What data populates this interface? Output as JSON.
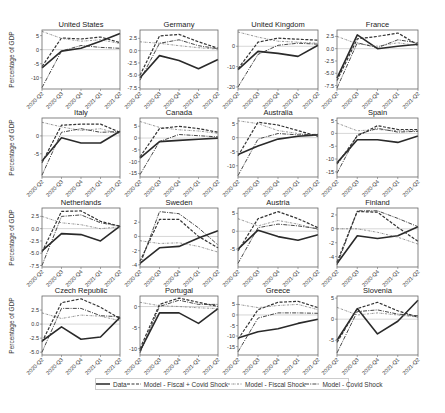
{
  "chart_data": {
    "type": "line",
    "layout": "4x4 small multiples",
    "ylabel": "Percentage of GDP",
    "x": [
      "2020-Q2",
      "2020-Q3",
      "2020-Q4",
      "2021-Q1",
      "2021-Q2"
    ],
    "legend": [
      {
        "name": "Data",
        "style": "solid",
        "width": 1.6
      },
      {
        "name": "Model - Fiscal + Covid Shock",
        "style": "dashed",
        "width": 1.2
      },
      {
        "name": "Model - Fiscal Shock",
        "style": "dotted-dash-thin",
        "width": 0.7
      },
      {
        "name": "Model - Covid Shock",
        "style": "dashdot",
        "width": 0.9
      }
    ],
    "panels": [
      {
        "title": "United States",
        "ylim": [
          -14,
          7
        ],
        "yticks": [
          5,
          0,
          -5,
          -10
        ],
        "ylabels": [
          "5",
          "0",
          "-5",
          "-10"
        ],
        "series": [
          [
            -6.5,
            -0.5,
            0.5,
            3.0,
            5.8
          ],
          [
            -6.0,
            4.2,
            3.8,
            4.5,
            2.5
          ],
          [
            6.5,
            4.0,
            3.0,
            3.5,
            2.2
          ],
          [
            -13.5,
            -0.5,
            1.5,
            0.8,
            0.5
          ]
        ]
      },
      {
        "title": "Germany",
        "ylim": [
          -7.8,
          4.2
        ],
        "yticks": [
          2.5,
          0,
          -2.5,
          -5,
          -7.5
        ],
        "ylabels": [
          "2.5",
          "0.0",
          "-2.5",
          "-5.0",
          "-7.5"
        ],
        "series": [
          [
            -5.5,
            -1.0,
            -2.0,
            -3.7,
            -1.8
          ],
          [
            -5.0,
            3.0,
            3.3,
            1.8,
            0.5
          ],
          [
            1.8,
            1.5,
            1.0,
            0.6,
            0.3
          ],
          [
            -6.0,
            1.5,
            2.2,
            1.0,
            0.4
          ]
        ]
      },
      {
        "title": "United Kingdom",
        "ylim": [
          -21,
          8
        ],
        "yticks": [
          0,
          -10,
          -20
        ],
        "ylabels": [
          "0",
          "-10",
          "-20"
        ],
        "series": [
          [
            -11.5,
            -2.5,
            -3.5,
            -5.0,
            0.5
          ],
          [
            -11.0,
            2.0,
            4.0,
            3.5,
            3.0
          ],
          [
            7.0,
            4.5,
            2.5,
            2.0,
            1.5
          ],
          [
            -20.0,
            -4.0,
            0.5,
            1.5,
            1.0
          ]
        ]
      },
      {
        "title": "France",
        "ylim": [
          -8.2,
          3.8
        ],
        "yticks": [
          2.5,
          0,
          -2.5,
          -5,
          -7.5
        ],
        "ylabels": [
          "2.5",
          "0.0",
          "-2.5",
          "-5.0",
          "-7.5"
        ],
        "series": [
          [
            -6.0,
            2.8,
            0.0,
            0.5,
            0.9
          ],
          [
            -6.5,
            2.0,
            2.5,
            3.2,
            0.8
          ],
          [
            2.5,
            1.0,
            0.5,
            1.2,
            0.6
          ],
          [
            -8.0,
            1.2,
            0.2,
            1.8,
            1.2
          ]
        ]
      },
      {
        "title": "Italy",
        "ylim": [
          -11.5,
          5
        ],
        "yticks": [
          0,
          -5
        ],
        "ylabels": [
          "0",
          "-5"
        ],
        "series": [
          [
            -7.0,
            -0.5,
            -2.0,
            -2.0,
            1.3
          ],
          [
            -7.5,
            3.0,
            3.3,
            3.3,
            1.0
          ],
          [
            3.8,
            2.5,
            1.5,
            2.0,
            0.5
          ],
          [
            -11.0,
            1.0,
            2.0,
            1.0,
            1.2
          ]
        ]
      },
      {
        "title": "Canada",
        "ylim": [
          -16.5,
          8.5
        ],
        "yticks": [
          5,
          0,
          -5,
          -10,
          -15
        ],
        "ylabels": [
          "5",
          "0",
          "-5",
          "-10",
          "-15"
        ],
        "series": [
          [
            -8.5,
            -1.5,
            -1.0,
            -0.5,
            0.0
          ],
          [
            -8.0,
            4.0,
            5.0,
            4.0,
            2.5
          ],
          [
            7.0,
            4.5,
            3.5,
            3.0,
            2.0
          ],
          [
            -15.5,
            -1.5,
            1.5,
            1.0,
            0.5
          ]
        ]
      },
      {
        "title": "Australia",
        "ylim": [
          -14,
          7
        ],
        "yticks": [
          5,
          0,
          -5,
          -10
        ],
        "ylabels": [
          "5",
          "0",
          "-5",
          "-10"
        ],
        "series": [
          [
            -6.0,
            -3.0,
            -0.5,
            0.5,
            1.0
          ],
          [
            -6.5,
            5.5,
            4.5,
            2.5,
            0.5
          ],
          [
            6.0,
            5.0,
            2.5,
            1.5,
            0.8
          ],
          [
            -13.5,
            -0.5,
            1.5,
            1.0,
            1.2
          ]
        ]
      },
      {
        "title": "Spain",
        "ylim": [
          -17,
          6
        ],
        "yticks": [
          5,
          0,
          -5,
          -10,
          -15
        ],
        "ylabels": [
          "5",
          "0",
          "-5",
          "-10",
          "-15"
        ],
        "series": [
          [
            -11.5,
            -2.5,
            -2.5,
            -3.5,
            -1.0
          ],
          [
            -12.0,
            -1.0,
            3.0,
            1.5,
            1.5
          ],
          [
            4.0,
            1.0,
            1.5,
            1.0,
            1.0
          ],
          [
            -15.5,
            -0.5,
            2.0,
            0.5,
            0.8
          ]
        ]
      },
      {
        "title": "Netherlands",
        "ylim": [
          -7.8,
          4.2
        ],
        "yticks": [
          2.5,
          0,
          -2.5,
          -5,
          -7.5
        ],
        "ylabels": [
          "2.5",
          "0.0",
          "-2.5",
          "-5.0",
          "-7.5"
        ],
        "series": [
          [
            -4.5,
            -1.0,
            -1.2,
            -2.5,
            0.5
          ],
          [
            -4.8,
            3.5,
            3.6,
            1.5,
            0.5
          ],
          [
            2.5,
            1.2,
            0.8,
            0.0,
            0.4
          ],
          [
            -7.5,
            2.5,
            2.8,
            1.2,
            0.5
          ]
        ]
      },
      {
        "title": "Sweden",
        "ylim": [
          -4.3,
          4
        ],
        "yticks": [
          2,
          0,
          -2,
          -4
        ],
        "ylabels": [
          "2",
          "0",
          "-2",
          "-4"
        ],
        "series": [
          [
            -3.8,
            -1.6,
            -1.4,
            -0.2,
            0.8
          ],
          [
            -3.5,
            2.4,
            2.4,
            0.0,
            -1.6
          ],
          [
            -0.6,
            -1.0,
            -0.9,
            -1.4,
            -2.2
          ],
          [
            -4.0,
            3.5,
            3.2,
            1.2,
            -1.2
          ]
        ]
      },
      {
        "title": "Austria",
        "ylim": [
          -10,
          6.5
        ],
        "yticks": [
          5,
          0,
          -5
        ],
        "ylabels": [
          "5",
          "0",
          "-5"
        ],
        "series": [
          [
            -5.0,
            0.3,
            -1.5,
            -2.5,
            -1.0
          ],
          [
            -5.5,
            3.5,
            5.5,
            3.5,
            1.0
          ],
          [
            3.5,
            1.5,
            3.0,
            2.0,
            0.5
          ],
          [
            -9.0,
            1.0,
            2.0,
            1.5,
            0.7
          ]
        ]
      },
      {
        "title": "Finland",
        "ylim": [
          -5.5,
          3
        ],
        "yticks": [
          2,
          0,
          -2,
          -4
        ],
        "ylabels": [
          "2",
          "0",
          "-2",
          "-4"
        ],
        "series": [
          [
            -5.0,
            -1.0,
            -1.4,
            -1.0,
            0.3
          ],
          [
            -4.8,
            2.5,
            2.4,
            0.2,
            -1.8
          ],
          [
            0.0,
            0.0,
            -0.5,
            -1.2,
            -2.2
          ],
          [
            -5.2,
            2.6,
            2.6,
            1.5,
            0.3
          ]
        ]
      },
      {
        "title": "Czech Republic",
        "ylim": [
          -5.5,
          5
        ],
        "yticks": [
          2.5,
          0,
          -2.5,
          -5
        ],
        "ylabels": [
          "2.5",
          "0.0",
          "-2.5",
          "-5.0"
        ],
        "series": [
          [
            -3.0,
            -0.5,
            -2.7,
            -2.3,
            1.2
          ],
          [
            -3.2,
            3.8,
            4.5,
            3.0,
            1.0
          ],
          [
            2.0,
            1.0,
            1.6,
            1.4,
            0.6
          ],
          [
            -5.0,
            2.8,
            2.8,
            1.5,
            1.3
          ]
        ]
      },
      {
        "title": "Portugal",
        "ylim": [
          -11.5,
          2.5
        ],
        "yticks": [
          0,
          -5,
          -10
        ],
        "ylabels": [
          "0",
          "-5",
          "-10"
        ],
        "series": [
          [
            -10.5,
            -1.5,
            -1.5,
            -4.0,
            -0.5
          ],
          [
            -10.0,
            0.5,
            2.0,
            1.0,
            0.0
          ],
          [
            1.0,
            0.2,
            0.0,
            -0.3,
            -0.5
          ],
          [
            -11.0,
            0.0,
            1.5,
            0.5,
            0.5
          ]
        ]
      },
      {
        "title": "Greece",
        "ylim": [
          -19,
          9
        ],
        "yticks": [
          5,
          0,
          -5,
          -10,
          -15
        ],
        "ylabels": [
          "5",
          "0",
          "-5",
          "-10",
          "-15"
        ],
        "series": [
          [
            -11.0,
            -8.0,
            -6.5,
            -4.0,
            -2.0
          ],
          [
            -11.5,
            2.5,
            6.0,
            6.5,
            3.5
          ],
          [
            5.0,
            3.5,
            4.5,
            5.0,
            2.5
          ],
          [
            -17.5,
            -1.5,
            1.0,
            1.0,
            0.8
          ]
        ]
      },
      {
        "title": "Slovenia",
        "ylim": [
          -8.5,
          5.5
        ],
        "yticks": [
          5,
          0,
          -5
        ],
        "ylabels": [
          "5",
          "0",
          "-5"
        ],
        "series": [
          [
            -5.0,
            2.5,
            -3.5,
            -0.5,
            4.5
          ],
          [
            -5.5,
            2.5,
            4.0,
            2.0,
            0.5
          ],
          [
            2.8,
            1.0,
            1.5,
            1.0,
            0.5
          ],
          [
            -8.0,
            1.8,
            2.2,
            1.2,
            0.8
          ]
        ]
      }
    ]
  },
  "legend": {
    "items": [
      "Data",
      "Model - Fiscal + Covid Shock",
      "Model - Fiscal Shock",
      "Model - Covid Shock"
    ]
  },
  "axis": {
    "ylabel": "Percentage of GDP",
    "xticks": [
      "2020-Q2",
      "2020-Q3",
      "2020-Q4",
      "2021-Q1",
      "2021-Q2"
    ]
  }
}
